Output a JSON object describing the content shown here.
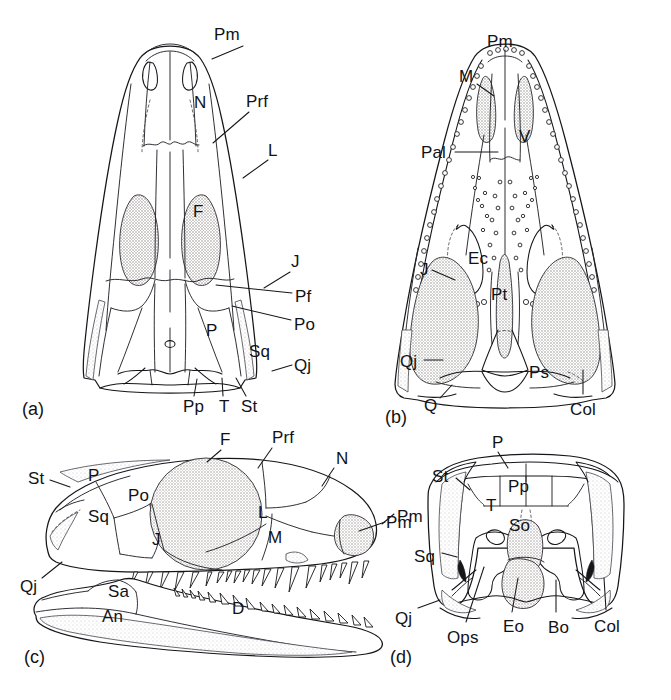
{
  "figure": {
    "background": "#ffffff",
    "ink": "#16161a",
    "stipple_fill": "#d8d6d2",
    "width": 671,
    "height": 700
  },
  "panels": [
    {
      "id": "a",
      "tag": "(a)",
      "view": "dorsal",
      "tag_pos": {
        "x": 22,
        "y": 400
      },
      "labels": [
        {
          "text": "Pm",
          "x": 214,
          "y": 26,
          "leader": {
            "x1": 243,
            "y1": 46,
            "x2": 212,
            "y2": 59
          }
        },
        {
          "text": "N",
          "x": 194,
          "y": 94,
          "leader": null
        },
        {
          "text": "Prf",
          "x": 246,
          "y": 93,
          "leader": {
            "x1": 249,
            "y1": 112,
            "x2": 213,
            "y2": 143
          }
        },
        {
          "text": "L",
          "x": 268,
          "y": 142,
          "leader": {
            "x1": 268,
            "y1": 160,
            "x2": 243,
            "y2": 178
          }
        },
        {
          "text": "F",
          "x": 193,
          "y": 203,
          "leader": null
        },
        {
          "text": "J",
          "x": 291,
          "y": 253,
          "leader": {
            "x1": 290,
            "y1": 272,
            "x2": 264,
            "y2": 288
          }
        },
        {
          "text": "Pf",
          "x": 295,
          "y": 288,
          "leader": {
            "x1": 292,
            "y1": 293,
            "x2": 216,
            "y2": 285
          }
        },
        {
          "text": "Po",
          "x": 294,
          "y": 316,
          "leader": {
            "x1": 291,
            "y1": 320,
            "x2": 232,
            "y2": 306
          }
        },
        {
          "text": "P",
          "x": 206,
          "y": 322,
          "leader": null
        },
        {
          "text": "Sq",
          "x": 249,
          "y": 343,
          "leader": null
        },
        {
          "text": "Qj",
          "x": 294,
          "y": 357,
          "leader": {
            "x1": 292,
            "y1": 365,
            "x2": 272,
            "y2": 371
          }
        },
        {
          "text": "Pp",
          "x": 183,
          "y": 398,
          "leader": {
            "x1": 194,
            "y1": 396,
            "x2": 197,
            "y2": 379
          }
        },
        {
          "text": "T",
          "x": 219,
          "y": 398,
          "leader": {
            "x1": 223,
            "y1": 396,
            "x2": 222,
            "y2": 378
          }
        },
        {
          "text": "St",
          "x": 241,
          "y": 398,
          "leader": {
            "x1": 246,
            "y1": 396,
            "x2": 236,
            "y2": 378
          }
        }
      ]
    },
    {
      "id": "b",
      "tag": "(b)",
      "view": "palatal",
      "tag_pos": {
        "x": 385,
        "y": 408
      },
      "labels": [
        {
          "text": "Pm",
          "x": 487,
          "y": 33,
          "leader": null
        },
        {
          "text": "M",
          "x": 459,
          "y": 68,
          "leader": {
            "x1": 477,
            "y1": 84,
            "x2": 494,
            "y2": 96
          }
        },
        {
          "text": "V",
          "x": 519,
          "y": 128,
          "leader": null
        },
        {
          "text": "Pal",
          "x": 421,
          "y": 144,
          "leader": {
            "x1": 455,
            "y1": 152,
            "x2": 498,
            "y2": 152
          }
        },
        {
          "text": "Ec",
          "x": 468,
          "y": 250,
          "leader": null
        },
        {
          "text": "J",
          "x": 420,
          "y": 261,
          "leader": {
            "x1": 432,
            "y1": 270,
            "x2": 455,
            "y2": 280
          }
        },
        {
          "text": "Pt",
          "x": 491,
          "y": 286,
          "leader": null
        },
        {
          "text": "Qj",
          "x": 400,
          "y": 353,
          "leader": {
            "x1": 424,
            "y1": 360,
            "x2": 443,
            "y2": 360
          }
        },
        {
          "text": "Ps",
          "x": 529,
          "y": 364,
          "leader": null
        },
        {
          "text": "Q",
          "x": 424,
          "y": 397,
          "leader": {
            "x1": 440,
            "y1": 398,
            "x2": 452,
            "y2": 385
          }
        },
        {
          "text": "Col",
          "x": 570,
          "y": 401,
          "leader": {
            "x1": 583,
            "y1": 394,
            "x2": 583,
            "y2": 370
          }
        }
      ]
    },
    {
      "id": "c",
      "tag": "(c)",
      "view": "lateral",
      "tag_pos": {
        "x": 24,
        "y": 648
      },
      "labels": [
        {
          "text": "F",
          "x": 220,
          "y": 431,
          "leader": {
            "x1": 221,
            "y1": 450,
            "x2": 207,
            "y2": 462
          }
        },
        {
          "text": "Prf",
          "x": 272,
          "y": 429,
          "leader": {
            "x1": 272,
            "y1": 448,
            "x2": 258,
            "y2": 468
          }
        },
        {
          "text": "N",
          "x": 336,
          "y": 450,
          "leader": {
            "x1": 334,
            "y1": 468,
            "x2": 322,
            "y2": 486
          }
        },
        {
          "text": "St",
          "x": 28,
          "y": 470,
          "leader": {
            "x1": 50,
            "y1": 480,
            "x2": 70,
            "y2": 487
          }
        },
        {
          "text": "P",
          "x": 88,
          "y": 467,
          "leader": null
        },
        {
          "text": "Po",
          "x": 128,
          "y": 487,
          "leader": null
        },
        {
          "text": "Sq",
          "x": 88,
          "y": 508,
          "leader": null
        },
        {
          "text": "L",
          "x": 258,
          "y": 504,
          "leader": null
        },
        {
          "text": "Pm",
          "x": 386,
          "y": 514,
          "leader": {
            "x1": 385,
            "y1": 522,
            "x2": 359,
            "y2": 531
          }
        },
        {
          "text": "J",
          "x": 152,
          "y": 531,
          "leader": null
        },
        {
          "text": "M",
          "x": 268,
          "y": 529,
          "leader": null
        },
        {
          "text": "Qj",
          "x": 20,
          "y": 578,
          "leader": {
            "x1": 42,
            "y1": 578,
            "x2": 62,
            "y2": 562
          }
        },
        {
          "text": "Sa",
          "x": 108,
          "y": 583,
          "leader": null
        },
        {
          "text": "An",
          "x": 102,
          "y": 608,
          "leader": null
        },
        {
          "text": "D",
          "x": 232,
          "y": 600,
          "leader": null
        }
      ]
    },
    {
      "id": "d",
      "tag": "(d)",
      "view": "occipital",
      "tag_pos": {
        "x": 390,
        "y": 648
      },
      "labels": [
        {
          "text": "P",
          "x": 492,
          "y": 434,
          "leader": {
            "x1": 498,
            "y1": 452,
            "x2": 508,
            "y2": 468
          }
        },
        {
          "text": "St",
          "x": 432,
          "y": 468,
          "leader": {
            "x1": 456,
            "y1": 478,
            "x2": 470,
            "y2": 490
          }
        },
        {
          "text": "Pp",
          "x": 508,
          "y": 478,
          "leader": null
        },
        {
          "text": "T",
          "x": 486,
          "y": 497,
          "leader": null
        },
        {
          "text": "Pm",
          "x": 397,
          "y": 508,
          "leader": {
            "x1": 394,
            "y1": 514,
            "x2": 382,
            "y2": 524
          }
        },
        {
          "text": "So",
          "x": 509,
          "y": 517,
          "leader": null
        },
        {
          "text": "Sq",
          "x": 414,
          "y": 548,
          "leader": {
            "x1": 442,
            "y1": 553,
            "x2": 457,
            "y2": 557
          }
        },
        {
          "text": "Qj",
          "x": 395,
          "y": 610,
          "leader": {
            "x1": 418,
            "y1": 608,
            "x2": 440,
            "y2": 600
          }
        },
        {
          "text": "Ops",
          "x": 447,
          "y": 629,
          "leader": {
            "x1": 466,
            "y1": 622,
            "x2": 484,
            "y2": 567
          }
        },
        {
          "text": "Eo",
          "x": 503,
          "y": 618,
          "leader": {
            "x1": 512,
            "y1": 612,
            "x2": 518,
            "y2": 578
          }
        },
        {
          "text": "Bo",
          "x": 548,
          "y": 619,
          "leader": {
            "x1": 556,
            "y1": 612,
            "x2": 556,
            "y2": 580
          }
        },
        {
          "text": "Col",
          "x": 594,
          "y": 618,
          "leader": {
            "x1": 606,
            "y1": 610,
            "x2": 604,
            "y2": 578
          }
        }
      ]
    }
  ],
  "legend_keys": {
    "Pm": "premaxilla",
    "M": "maxilla",
    "N": "nasal",
    "Prf": "prefrontal",
    "L": "lacrimal",
    "F": "frontal",
    "Pf": "postfrontal",
    "Po": "postorbital",
    "P": "parietal",
    "Sq": "squamosal",
    "Qj": "quadratojugal",
    "J": "jugal",
    "Q": "quadrate",
    "Pp": "postparietal",
    "T": "tabular",
    "St": "supratemporal",
    "V": "vomer",
    "Pal": "palatine",
    "Ec": "ectopterygoid",
    "Pt": "pterygoid",
    "Ps": "parasphenoid",
    "Col": "columella",
    "So": "supraoccipital",
    "Eo": "exoccipital",
    "Bo": "basioccipital",
    "Ops": "opisthotic",
    "Sa": "surangular",
    "An": "angular",
    "D": "dentary"
  }
}
